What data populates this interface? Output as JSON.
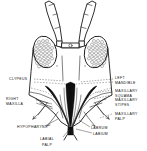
{
  "figure": {
    "background_color": "#ffffff",
    "ink_color": "#111111"
  },
  "labels": {
    "clypeus": "CLYPEUS",
    "right_maxilla_line1": "RIGHT",
    "right_maxilla_line2": "MAXILLA",
    "left_mandible_line1": "LEFT",
    "left_mandible_line2": "MANDIBLE",
    "maxillary_squama_line1": "MAXILLARY",
    "maxillary_squama_line2": "SQUAMA",
    "maxillary_stipes_line1": "MAXILLARY",
    "maxillary_stipes_line2": "STIPES",
    "maxillary_palp_line1": "MAXILLARY",
    "maxillary_palp_line2": "PALP",
    "hypopharynx": "HYPOPHARYNX",
    "labrum": "LABRUM",
    "labium": "LABIUM",
    "labial_palp_line1": "LABIAL",
    "labial_palp_line2": "PALP"
  },
  "parts": {
    "antenna_left": "left-antenna",
    "antenna_right": "right-antenna",
    "compound_eye_left": "left-compound-eye",
    "compound_eye_right": "right-compound-eye",
    "head_capsule": "head-capsule",
    "clypeus_region": "clypeus-region",
    "mandible_left": "left-mandible-stylet",
    "mandible_right": "right-mandible-stylet",
    "maxilla_left": "left-maxilla",
    "maxilla_right": "right-maxilla",
    "stylet_bundle": "stylet-bundle",
    "labium_tip": "labium-tip"
  }
}
